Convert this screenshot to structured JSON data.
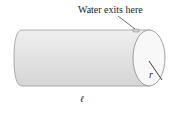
{
  "diagram": {
    "labels": {
      "outlet": "Water exits here",
      "radius": "r",
      "length": "ℓ"
    },
    "colors": {
      "body": "#e4e4e4",
      "end_face": "#f7f7f7",
      "outline": "#8a8a8a",
      "leader": "#333333"
    }
  }
}
